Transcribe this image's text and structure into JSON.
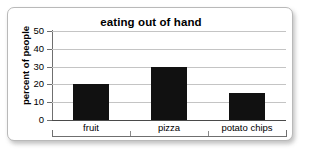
{
  "chart_data": {
    "type": "bar",
    "title": "eating out of hand",
    "xlabel": "",
    "ylabel": "percent of people",
    "categories": [
      "fruit",
      "pizza",
      "potato chips"
    ],
    "values": [
      20,
      30,
      15
    ],
    "ylim": [
      0,
      50
    ],
    "yticks": [
      0,
      10,
      20,
      30,
      40,
      50
    ],
    "ytick_labels": [
      "0",
      "10",
      "20",
      "30",
      "40",
      "50"
    ],
    "grid": true,
    "legend": false,
    "bar_color": "#111111",
    "gridline_color": "#c4c4c4",
    "axis_color": "#6f6f6f",
    "background": "#ffffff",
    "frame_border_color": "#b9b9b9"
  }
}
